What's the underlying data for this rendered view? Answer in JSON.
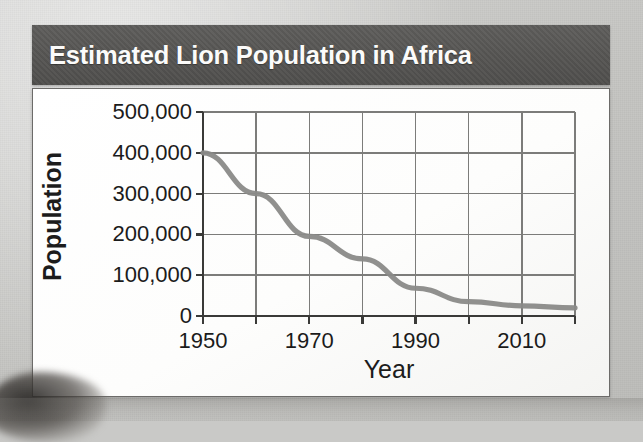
{
  "banner": {
    "title": "Estimated Lion Population in Africa"
  },
  "chart_data": {
    "type": "line",
    "title": "Estimated Lion Population in Africa",
    "xlabel": "Year",
    "ylabel": "Population",
    "grid": true,
    "legend": false,
    "xlim": [
      1950,
      2020
    ],
    "ylim": [
      0,
      500000
    ],
    "x_tick_values": [
      1950,
      1960,
      1970,
      1980,
      1990,
      2000,
      2010,
      2020
    ],
    "x_tick_labels": [
      "1950",
      "",
      "1970",
      "",
      "1990",
      "",
      "2010",
      ""
    ],
    "y_tick_values": [
      0,
      100000,
      200000,
      300000,
      400000,
      500000
    ],
    "y_tick_labels": [
      "0",
      "100,000",
      "200,000",
      "300,000",
      "400,000",
      "500,000"
    ],
    "series": [
      {
        "name": "Lion population",
        "color": "#8a8a88",
        "x": [
          1950,
          1960,
          1970,
          1980,
          1990,
          2000,
          2010,
          2020
        ],
        "values": [
          400000,
          300000,
          195000,
          140000,
          68000,
          35000,
          25000,
          20000
        ]
      }
    ]
  },
  "style": {
    "background": "#c9c9c7",
    "banner_bg": "#56554f",
    "banner_text": "#fbfbfa",
    "card_bg": "#ffffff",
    "card_border": "#6c6b69",
    "axis_color": "#3a3a38",
    "grid_color": "#7c7c7a",
    "line_color": "#8a8a88",
    "tick_text": "#1b1b1b"
  }
}
